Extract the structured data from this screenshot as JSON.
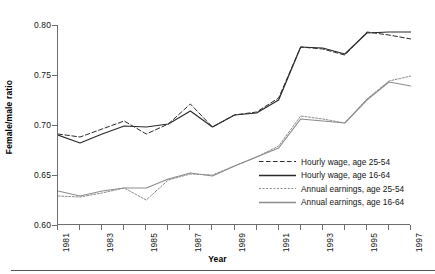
{
  "axes": {
    "y_title": "Female/male ratio",
    "x_title": "Year",
    "y_ticks": [
      "0.80",
      "0.75",
      "0.70",
      "0.65",
      "0.60"
    ],
    "x_ticks": [
      "1981",
      "1983",
      "1985",
      "1987",
      "1989",
      "1991",
      "1993",
      "1995",
      "1997"
    ]
  },
  "legend": {
    "items": [
      {
        "label": "Hourly wage, age 25-54",
        "style": "dashed",
        "color": "#2b2b2b"
      },
      {
        "label": "Hourly wage, age 16-64",
        "style": "solid",
        "color": "#2b2b2b"
      },
      {
        "label": "Annual earnings, age 25-54",
        "style": "dotted",
        "color": "#8c8c8c"
      },
      {
        "label": "Annual earnings, age 16-64",
        "style": "solid",
        "color": "#8c8c8c"
      }
    ]
  },
  "chart_data": {
    "type": "line",
    "title": "",
    "xlabel": "Year",
    "ylabel": "Female/male ratio",
    "xlim": [
      1981,
      1997
    ],
    "ylim": [
      0.6,
      0.8
    ],
    "ytick_values": [
      0.8,
      0.75,
      0.7,
      0.65,
      0.6
    ],
    "xtick_values": [
      1981,
      1983,
      1985,
      1987,
      1989,
      1991,
      1993,
      1995,
      1997
    ],
    "grid": false,
    "legend_position": "lower-right",
    "x": [
      1981,
      1982,
      1983,
      1984,
      1985,
      1986,
      1987,
      1988,
      1989,
      1990,
      1991,
      1992,
      1993,
      1994,
      1995,
      1996,
      1997
    ],
    "series": [
      {
        "name": "Hourly wage, age 25-54",
        "style": "dashed",
        "color": "#2b2b2b",
        "values": [
          0.691,
          0.688,
          0.696,
          0.704,
          0.691,
          0.701,
          0.721,
          0.698,
          0.71,
          0.713,
          0.727,
          0.778,
          0.776,
          0.77,
          0.793,
          0.79,
          0.786
        ]
      },
      {
        "name": "Hourly wage, age 16-64",
        "style": "solid",
        "color": "#2b2b2b",
        "values": [
          0.69,
          0.682,
          0.691,
          0.699,
          0.698,
          0.701,
          0.714,
          0.698,
          0.71,
          0.712,
          0.725,
          0.778,
          0.777,
          0.771,
          0.792,
          0.793,
          0.793
        ]
      },
      {
        "name": "Annual earnings, age 25-54",
        "style": "dotted",
        "color": "#8c8c8c",
        "values": [
          0.629,
          0.628,
          0.632,
          0.637,
          0.625,
          0.645,
          0.651,
          0.65,
          0.659,
          0.668,
          0.679,
          0.709,
          0.706,
          0.702,
          0.726,
          0.744,
          0.749
        ]
      },
      {
        "name": "Annual earnings, age 16-64",
        "style": "solid",
        "color": "#8c8c8c",
        "values": [
          0.634,
          0.629,
          0.634,
          0.637,
          0.637,
          0.646,
          0.652,
          0.649,
          0.659,
          0.668,
          0.677,
          0.706,
          0.704,
          0.702,
          0.725,
          0.743,
          0.739
        ]
      }
    ]
  }
}
